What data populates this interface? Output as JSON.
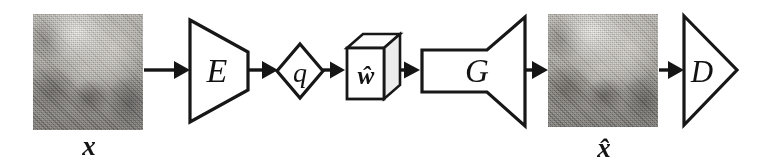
{
  "figure": {
    "kind": "neural-network-architecture-diagram",
    "background_color": "#ffffff",
    "ink_color": "#151515"
  },
  "nodes": {
    "input_image": {
      "name": "input-image",
      "caption": "x",
      "shape": "image-patch",
      "description": "grayscale photograph patch"
    },
    "encoder": {
      "name": "encoder",
      "label": "E",
      "shape": "trapezoid-narrowing-right"
    },
    "quantizer": {
      "name": "quantizer",
      "label": "q",
      "shape": "diamond"
    },
    "latent_code": {
      "name": "latent-code",
      "label": "ŵ",
      "shape": "cube-3d"
    },
    "generator": {
      "name": "generator",
      "label": "G",
      "shape": "rectangle-flaring-right"
    },
    "output_image": {
      "name": "reconstructed-image",
      "caption": "x̂",
      "shape": "image-patch",
      "description": "grayscale reconstructed photograph patch"
    },
    "discriminator": {
      "name": "discriminator",
      "label": "D",
      "shape": "triangle-pointing-right"
    }
  },
  "flow": [
    {
      "from": "input-image",
      "to": "encoder"
    },
    {
      "from": "encoder",
      "to": "quantizer"
    },
    {
      "from": "quantizer",
      "to": "latent-code"
    },
    {
      "from": "latent-code",
      "to": "generator"
    },
    {
      "from": "generator",
      "to": "reconstructed-image"
    },
    {
      "from": "reconstructed-image",
      "to": "discriminator"
    }
  ],
  "captions": {
    "input": "x",
    "output": "x̂"
  }
}
